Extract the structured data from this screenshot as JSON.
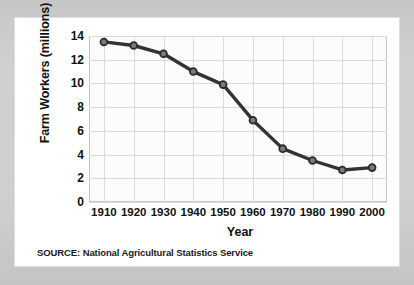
{
  "figure": {
    "source_note": "SOURCE: National Agricultural Statistics Service"
  },
  "chart_data": {
    "type": "line",
    "title": "",
    "xlabel": "Year",
    "ylabel": "Farm Workers (millions)",
    "x": [
      1910,
      1920,
      1930,
      1940,
      1950,
      1960,
      1970,
      1980,
      1990,
      2000
    ],
    "categories": [
      "1910",
      "1920",
      "1930",
      "1940",
      "1950",
      "1960",
      "1970",
      "1980",
      "1990",
      "2000"
    ],
    "values": [
      13.5,
      13.2,
      12.5,
      11.0,
      9.9,
      6.9,
      4.5,
      3.5,
      2.7,
      2.9
    ],
    "series": [
      {
        "name": "Farm Workers",
        "values": [
          13.5,
          13.2,
          12.5,
          11.0,
          9.9,
          6.9,
          4.5,
          3.5,
          2.7,
          2.9
        ]
      }
    ],
    "ylim": [
      0,
      14
    ],
    "xlim": [
      1905,
      2005
    ],
    "yticks": [
      0,
      2,
      4,
      6,
      8,
      10,
      12,
      14
    ],
    "ytick_labels": [
      "0",
      "2",
      "4",
      "6",
      "8",
      "10",
      "12",
      "14"
    ],
    "xticks": [
      1910,
      1920,
      1930,
      1940,
      1950,
      1960,
      1970,
      1980,
      1990,
      2000
    ],
    "grid": true,
    "legend": "none",
    "line_color": "#333333",
    "marker_color": "#7a7a7a",
    "marker_edge_color": "#2b2b2b",
    "grid_color": "#dadada",
    "plot_background": "#fbfbfb",
    "card_background": "#ffffff",
    "page_background": "#c9c9c9"
  }
}
